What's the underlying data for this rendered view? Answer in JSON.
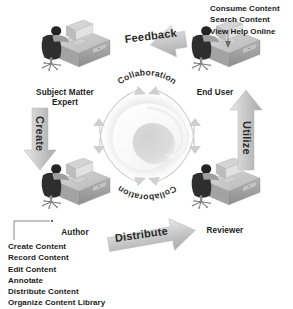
{
  "diagram": {
    "background_color": "#ffffff",
    "roles": [
      {
        "id": "subject-matter-expert",
        "label_line1": "Subject Matter",
        "label_line2": "Expert"
      },
      {
        "id": "end-user",
        "label_line1": "End User",
        "label_line2": ""
      },
      {
        "id": "author",
        "label_line1": "Author",
        "label_line2": ""
      },
      {
        "id": "reviewer",
        "label_line1": "Reviewer",
        "label_line2": ""
      }
    ],
    "flow_arrows": [
      {
        "id": "feedback",
        "label": "Feedback"
      },
      {
        "id": "create",
        "label": "Create"
      },
      {
        "id": "distribute",
        "label": "Distribute"
      },
      {
        "id": "utilize",
        "label": "Utilize"
      }
    ],
    "center": {
      "top_label": "Collaboration",
      "bottom_label": "Collaboration",
      "logo_name": "swirl-triangle-logo"
    },
    "end_user_callout": {
      "items": [
        "Consume Content",
        "Search Content",
        "View Help Online"
      ]
    },
    "author_callout": {
      "items": [
        "Create Content",
        "Record Content",
        "Edit Content",
        "Annotate",
        "Distribute Content",
        "Organize Content Library"
      ]
    },
    "colors": {
      "text": "#1c1c1c",
      "arrow_fill": "#c9c9c9",
      "arrow_stroke": "#b0b0b0",
      "ring_arc": "#cfcfcf",
      "desk_dark": "#3a3a3a",
      "desk_mid": "#9a9a9a",
      "desk_light": "#d8d8d8"
    }
  }
}
